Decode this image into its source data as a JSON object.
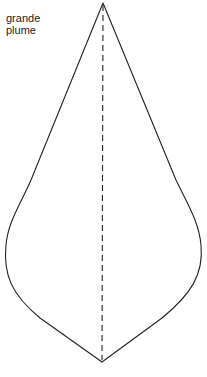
{
  "label": {
    "line1": "grande",
    "line2": "plume"
  },
  "diagram": {
    "shape": "feather-template",
    "outline_color": "#222222",
    "fold_line": "dashed",
    "top_point": [
      103,
      3
    ],
    "bottom_point": [
      102,
      362
    ]
  }
}
